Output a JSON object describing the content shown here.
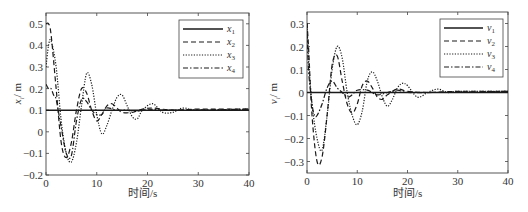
{
  "chart_data": [
    {
      "type": "line",
      "title": "",
      "xlabel": "时间/s",
      "ylabel": "x_i / m",
      "xlim": [
        0,
        40
      ],
      "ylim": [
        -0.2,
        0.55
      ],
      "xticks": [
        0,
        10,
        20,
        30,
        40
      ],
      "yticks": [
        -0.2,
        -0.1,
        0,
        0.1,
        0.2,
        0.3,
        0.4,
        0.5
      ],
      "ytick_labels": [
        "-0.2",
        "-0.1",
        "0",
        "0.1",
        "0.2",
        "0.3",
        "0.4",
        "0.5"
      ],
      "grid": false,
      "legend_position": "upper right",
      "series": [
        {
          "name": "x1",
          "style": "solid",
          "x": [
            0,
            40
          ],
          "y": [
            0.1,
            0.1
          ]
        },
        {
          "name": "x2",
          "style": "dashed",
          "x": [
            0,
            0.5,
            1,
            2,
            3,
            4,
            5,
            6,
            7,
            8,
            9,
            10,
            11,
            12,
            13,
            14,
            15,
            17,
            19,
            21,
            25,
            30,
            40
          ],
          "y": [
            0.5,
            0.5,
            0.45,
            0.2,
            -0.05,
            -0.12,
            -0.05,
            0.1,
            0.2,
            0.18,
            0.1,
            0.05,
            0.08,
            0.12,
            0.13,
            0.11,
            0.09,
            0.09,
            0.105,
            0.11,
            0.1,
            0.105,
            0.105
          ]
        },
        {
          "name": "x3",
          "style": "dotted",
          "x": [
            0,
            0.5,
            1,
            2,
            3,
            4,
            5,
            6,
            7,
            8,
            9,
            10,
            11,
            12,
            13,
            14,
            15,
            16,
            17,
            18,
            19,
            21,
            23,
            25,
            27,
            30,
            40
          ],
          "y": [
            0.3,
            0.4,
            0.42,
            0.3,
            0.05,
            -0.1,
            -0.14,
            -0.05,
            0.12,
            0.27,
            0.22,
            0.08,
            -0.01,
            0.03,
            0.1,
            0.16,
            0.17,
            0.12,
            0.07,
            0.06,
            0.1,
            0.13,
            0.09,
            0.09,
            0.11,
            0.1,
            0.105
          ]
        },
        {
          "name": "x4",
          "style": "dashdot",
          "x": [
            0,
            0.5,
            1,
            1.5,
            2,
            3,
            4,
            5,
            6,
            7,
            8,
            9,
            10,
            11,
            12,
            14,
            16,
            18,
            20,
            25,
            40
          ],
          "y": [
            0.22,
            0.2,
            0.2,
            0.17,
            0.15,
            0.02,
            -0.1,
            -0.11,
            0.05,
            0.15,
            0.14,
            0.1,
            0.08,
            0.08,
            0.11,
            0.1,
            0.1,
            0.095,
            0.105,
            0.1,
            0.105
          ]
        }
      ]
    },
    {
      "type": "line",
      "title": "",
      "xlabel": "时间/s",
      "ylabel": "v_i / m",
      "xlim": [
        0,
        40
      ],
      "ylim": [
        -0.35,
        0.35
      ],
      "xticks": [
        0,
        10,
        20,
        30,
        40
      ],
      "yticks": [
        -0.3,
        -0.2,
        -0.1,
        0,
        0.1,
        0.2,
        0.3
      ],
      "ytick_labels": [
        "-0.3",
        "-0.2",
        "-0.1",
        "0",
        "0.1",
        "0.2",
        "0.3"
      ],
      "grid": false,
      "legend_position": "upper right",
      "series": [
        {
          "name": "v1",
          "style": "solid",
          "x": [
            0,
            40
          ],
          "y": [
            0,
            0
          ]
        },
        {
          "name": "v2",
          "style": "dashed",
          "x": [
            0,
            0.3,
            1,
            2,
            3,
            4,
            5,
            6,
            7,
            8,
            9,
            10,
            11,
            12,
            13,
            14,
            15,
            16,
            18,
            20,
            24,
            30,
            40
          ],
          "y": [
            0.3,
            0.2,
            -0.1,
            -0.3,
            -0.28,
            -0.1,
            0.12,
            0.16,
            0.05,
            -0.05,
            -0.09,
            -0.05,
            0.03,
            0.05,
            0.02,
            -0.02,
            -0.03,
            -0.01,
            0.015,
            0.005,
            0,
            0.005,
            0.005
          ]
        },
        {
          "name": "v3",
          "style": "dotted",
          "x": [
            0,
            0.3,
            1,
            2,
            3,
            4,
            5,
            6,
            7,
            8,
            9,
            10,
            11,
            12,
            13,
            14,
            15,
            16,
            17,
            18,
            19,
            20,
            22,
            24,
            26,
            28,
            30,
            40
          ],
          "y": [
            0.3,
            0.15,
            -0.05,
            -0.2,
            -0.25,
            -0.1,
            0.1,
            0.2,
            0.15,
            0.0,
            -0.1,
            -0.14,
            -0.08,
            0.05,
            0.09,
            0.05,
            -0.02,
            -0.06,
            -0.03,
            0.02,
            0.04,
            0.03,
            -0.02,
            0.0,
            0.015,
            0.0,
            0.005,
            0.005
          ]
        },
        {
          "name": "v4",
          "style": "dashdot",
          "x": [
            0,
            0.3,
            1,
            1.5,
            2,
            3,
            4,
            5,
            6,
            7,
            8,
            9,
            10,
            12,
            14,
            16,
            18,
            20,
            25,
            40
          ],
          "y": [
            0.3,
            0.1,
            -0.05,
            -0.1,
            -0.1,
            -0.05,
            0.02,
            0.05,
            0.02,
            0.0,
            -0.02,
            -0.01,
            0.01,
            0.01,
            -0.01,
            0.0,
            0.01,
            0.0,
            0.0,
            0.005
          ]
        }
      ]
    }
  ],
  "panels": [
    {
      "xlabel": "时间/s",
      "ylabel_main": "x",
      "ylabel_sub": "i",
      "ylabel_unit": "/ m",
      "legend": [
        {
          "main": "x",
          "sub": "1"
        },
        {
          "main": "x",
          "sub": "2"
        },
        {
          "main": "x",
          "sub": "3"
        },
        {
          "main": "x",
          "sub": "4"
        }
      ]
    },
    {
      "xlabel": "时间/s",
      "ylabel_main": "v",
      "ylabel_sub": "i",
      "ylabel_unit": "/ m",
      "legend": [
        {
          "main": "v",
          "sub": "1"
        },
        {
          "main": "v",
          "sub": "2"
        },
        {
          "main": "v",
          "sub": "3"
        },
        {
          "main": "v",
          "sub": "4"
        }
      ]
    }
  ]
}
